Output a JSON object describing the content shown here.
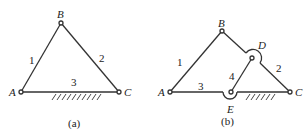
{
  "figure_a": {
    "caption": "(a)",
    "points": {
      "A": "A",
      "B": "B",
      "C": "C"
    },
    "links": {
      "l1": "1",
      "l2": "2",
      "l3": "3"
    }
  },
  "figure_b": {
    "caption": "(b)",
    "points": {
      "A": "A",
      "B": "B",
      "C": "C",
      "D": "D",
      "E": "E"
    },
    "links": {
      "l1": "1",
      "l2": "2",
      "l3": "3",
      "l4": "4"
    }
  },
  "colors": {
    "line": "#333333",
    "background": "#ffffff"
  }
}
